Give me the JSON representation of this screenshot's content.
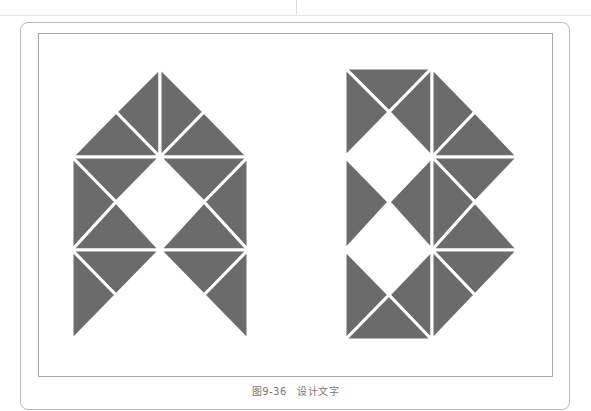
{
  "figure": {
    "caption": "图9-36　设计文字",
    "letters": [
      "A",
      "B"
    ],
    "fill_color": "#6b6b6b",
    "gap_color": "#ffffff",
    "frame_color": "#b9b9b9"
  }
}
